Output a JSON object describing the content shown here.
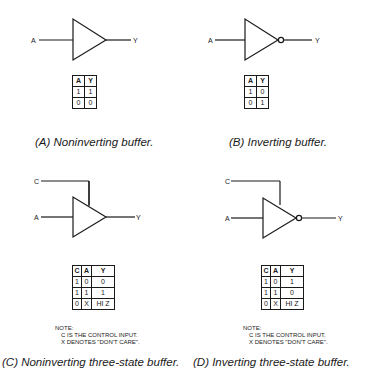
{
  "panels": {
    "a": {
      "caption": "(A) Noninverting buffer.",
      "input_label": "A",
      "output_label": "Y",
      "truth_table": {
        "headers": [
          "A",
          "Y"
        ],
        "rows": [
          [
            "1",
            "1"
          ],
          [
            "0",
            "0"
          ]
        ]
      }
    },
    "b": {
      "caption": "(B) Inverting buffer.",
      "input_label": "A",
      "output_label": "Y",
      "truth_table": {
        "headers": [
          "A",
          "Y"
        ],
        "rows": [
          [
            "1",
            "0"
          ],
          [
            "0",
            "1"
          ]
        ]
      }
    },
    "c": {
      "caption": "(C) Noninverting three-state buffer.",
      "control_label": "C",
      "input_label": "A",
      "output_label": "Y",
      "truth_table": {
        "headers": [
          "C",
          "A",
          "Y"
        ],
        "rows": [
          [
            "1",
            "0",
            "0"
          ],
          [
            "1",
            "1",
            "1"
          ],
          [
            "0",
            "X",
            "HI Z"
          ]
        ]
      },
      "note": {
        "title": "NOTE:",
        "line1": "C IS THE CONTROL INPUT.",
        "line2": "X DENOTES \"DON'T CARE\"."
      }
    },
    "d": {
      "caption": "(D) Inverting three-state buffer.",
      "control_label": "C",
      "input_label": "A",
      "output_label": "Y",
      "truth_table": {
        "headers": [
          "C",
          "A",
          "Y"
        ],
        "rows": [
          [
            "1",
            "0",
            "1"
          ],
          [
            "1",
            "1",
            "0"
          ],
          [
            "0",
            "X",
            "HI Z"
          ]
        ]
      },
      "note": {
        "title": "NOTE:",
        "line1": "C IS THE CONTROL INPUT.",
        "line2": "X DENOTES \"DON'T CARE\"."
      }
    }
  }
}
